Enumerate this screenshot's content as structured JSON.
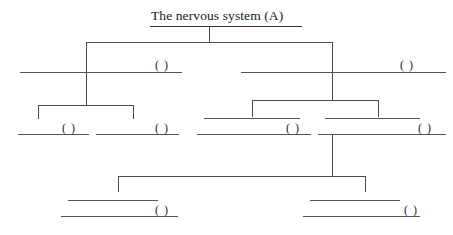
{
  "diagram": {
    "type": "hierarchy-tree-worksheet",
    "title": {
      "text": "The nervous system (A)",
      "underlined": true
    },
    "blank_marker": "(  )",
    "levels": [
      {
        "level": 1,
        "nodes": [
          {
            "id": "root",
            "label": "The nervous system (A)",
            "blank": false
          }
        ]
      },
      {
        "level": 2,
        "nodes": [
          {
            "id": "n2-left",
            "label": "(  )",
            "blank": true,
            "lines": 1
          },
          {
            "id": "n2-right",
            "label": "(  )",
            "blank": true,
            "lines": 1
          }
        ]
      },
      {
        "level": 3,
        "nodes": [
          {
            "id": "n3-a",
            "label": "(  )",
            "blank": true,
            "lines": 1
          },
          {
            "id": "n3-b",
            "label": "(  )",
            "blank": true,
            "lines": 1
          },
          {
            "id": "n3-c",
            "label": "(  )",
            "blank": true,
            "lines": 2
          },
          {
            "id": "n3-d",
            "label": "(  )",
            "blank": true,
            "lines": 2
          }
        ]
      },
      {
        "level": 4,
        "nodes": [
          {
            "id": "n4-a",
            "label": "(  )",
            "blank": true,
            "lines": 2
          },
          {
            "id": "n4-b",
            "label": "(  )",
            "blank": true,
            "lines": 2
          }
        ]
      }
    ],
    "colors": {
      "line": "#4a4a52",
      "blank": "#55555d",
      "text": "#17171c",
      "background": "#ffffff"
    }
  }
}
